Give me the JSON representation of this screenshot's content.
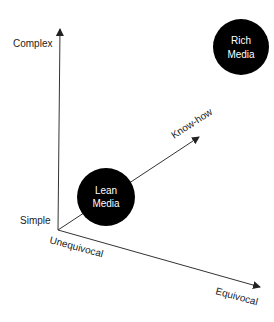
{
  "diagram": {
    "axes": {
      "vertical": {
        "top_label": "Complex",
        "bottom_label": "Simple"
      },
      "horizontal": {
        "start_label": "Unequivocal",
        "end_label": "Equivocal"
      },
      "diagonal": {
        "label": "Know-how"
      }
    },
    "nodes": [
      {
        "id": "lean",
        "line1": "Lean",
        "line2": "Media",
        "fill": "#000000"
      },
      {
        "id": "rich",
        "line1": "Rich",
        "line2": "Media",
        "fill": "#000000"
      }
    ],
    "colors": {
      "line": "#333333",
      "text": "#222222",
      "node_text": "#ffffff"
    }
  }
}
